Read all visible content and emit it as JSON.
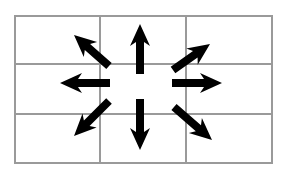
{
  "diagram": {
    "colors": {
      "background": "#ffffff",
      "grid_line": "#9a9a9a",
      "arrow": "#000000"
    },
    "grid": {
      "rows": 3,
      "cols": 3,
      "x_lines": [
        15,
        100,
        186,
        272
      ],
      "y_lines": [
        16,
        64,
        114,
        163
      ],
      "stroke_width": 2
    },
    "center": [
      140,
      83
    ],
    "arrows": [
      {
        "direction": "up",
        "from": [
          140,
          74
        ],
        "to": [
          140,
          24
        ]
      },
      {
        "direction": "down",
        "from": [
          140,
          99
        ],
        "to": [
          140,
          150
        ]
      },
      {
        "direction": "left",
        "from": [
          110,
          83
        ],
        "to": [
          60,
          83
        ]
      },
      {
        "direction": "right",
        "from": [
          172,
          83
        ],
        "to": [
          222,
          83
        ]
      },
      {
        "direction": "up-left",
        "from": [
          109,
          66
        ],
        "to": [
          74,
          35
        ]
      },
      {
        "direction": "up-right",
        "from": [
          173,
          70
        ],
        "to": [
          210,
          44
        ]
      },
      {
        "direction": "down-left",
        "from": [
          109,
          101
        ],
        "to": [
          74,
          136
        ]
      },
      {
        "direction": "down-right",
        "from": [
          174,
          107
        ],
        "to": [
          212,
          140
        ]
      }
    ]
  }
}
